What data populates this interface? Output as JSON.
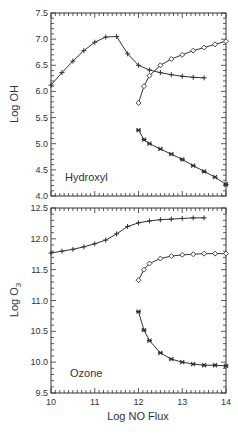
{
  "chart_data": [
    {
      "type": "line",
      "panel": "top",
      "annotation": "Hydroxyl",
      "xlabel": "",
      "ylabel": "Log OH",
      "xlim": [
        10,
        14
      ],
      "ylim": [
        4.0,
        7.5
      ],
      "xticks": [
        10,
        11,
        12,
        13,
        14
      ],
      "yticks": [
        4.0,
        4.5,
        5.0,
        5.5,
        6.0,
        6.5,
        7.0,
        7.5
      ],
      "ytick_labels": [
        "4.0",
        "4.5",
        "5.0",
        "5.5",
        "6.0",
        "6.5",
        "7.0",
        "7.5"
      ],
      "grid": false,
      "series": [
        {
          "name": "cross",
          "marker": "plus",
          "x": [
            10.0,
            10.25,
            10.5,
            10.75,
            11.0,
            11.25,
            11.5,
            11.75,
            12.0,
            12.25,
            12.5,
            12.75,
            13.0,
            13.25,
            13.5
          ],
          "y": [
            6.12,
            6.36,
            6.58,
            6.78,
            6.94,
            7.04,
            7.05,
            6.72,
            6.5,
            6.41,
            6.36,
            6.32,
            6.29,
            6.27,
            6.26
          ]
        },
        {
          "name": "diamond",
          "marker": "diamond",
          "x": [
            12.0,
            12.125,
            12.25,
            12.5,
            12.75,
            13.0,
            13.25,
            13.5,
            13.75,
            14.0
          ],
          "y": [
            5.78,
            6.1,
            6.3,
            6.5,
            6.62,
            6.7,
            6.78,
            6.84,
            6.9,
            6.96
          ]
        },
        {
          "name": "star",
          "marker": "star",
          "x": [
            12.0,
            12.125,
            12.25,
            12.5,
            12.75,
            13.0,
            13.25,
            13.5,
            13.75,
            14.0
          ],
          "y": [
            5.26,
            5.08,
            5.0,
            4.9,
            4.8,
            4.7,
            4.58,
            4.47,
            4.36,
            4.22
          ]
        }
      ]
    },
    {
      "type": "line",
      "panel": "bottom",
      "annotation": "Ozone",
      "xlabel": "Log NO Flux",
      "ylabel": "Log O3",
      "xlim": [
        10,
        14
      ],
      "ylim": [
        9.5,
        12.5
      ],
      "xticks": [
        10,
        11,
        12,
        13,
        14
      ],
      "xtick_labels": [
        "10",
        "11",
        "12",
        "13",
        "14"
      ],
      "yticks": [
        9.5,
        10.0,
        10.5,
        11.0,
        11.5,
        12.0,
        12.5
      ],
      "ytick_labels": [
        "9.5",
        "10.0",
        "10.5",
        "11.0",
        "11.5",
        "12.0",
        "12.5"
      ],
      "grid": false,
      "series": [
        {
          "name": "cross",
          "marker": "plus",
          "x": [
            10.0,
            10.25,
            10.5,
            10.75,
            11.0,
            11.25,
            11.5,
            11.75,
            12.0,
            12.25,
            12.5,
            12.75,
            13.0,
            13.25,
            13.5
          ],
          "y": [
            11.77,
            11.8,
            11.83,
            11.87,
            11.92,
            11.98,
            12.08,
            12.2,
            12.26,
            12.29,
            12.31,
            12.32,
            12.33,
            12.34,
            12.34
          ]
        },
        {
          "name": "diamond",
          "marker": "diamond",
          "x": [
            12.0,
            12.125,
            12.25,
            12.5,
            12.75,
            13.0,
            13.25,
            13.5,
            13.75,
            14.0
          ],
          "y": [
            11.33,
            11.5,
            11.6,
            11.68,
            11.72,
            11.74,
            11.75,
            11.76,
            11.76,
            11.76
          ]
        },
        {
          "name": "star",
          "marker": "star",
          "x": [
            12.0,
            12.125,
            12.25,
            12.5,
            12.75,
            13.0,
            13.25,
            13.5,
            13.75,
            14.0
          ],
          "y": [
            10.82,
            10.52,
            10.35,
            10.15,
            10.05,
            10.0,
            9.97,
            9.95,
            9.95,
            9.94
          ]
        }
      ]
    }
  ],
  "labels": {
    "top_ylabel": "Log OH",
    "top_annotation": "Hydroxyl",
    "bottom_ylabel_main": "Log O",
    "bottom_ylabel_sub": "3",
    "bottom_annotation": "Ozone",
    "xlabel": "Log NO Flux"
  },
  "colors": {
    "line": "#333333",
    "frame": "#333333"
  }
}
